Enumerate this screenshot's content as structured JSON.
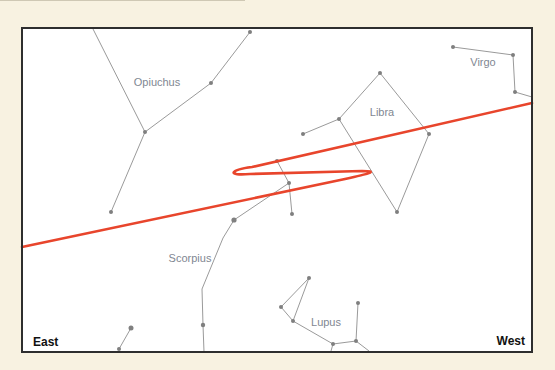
{
  "diagram": {
    "type": "sky-chart",
    "frame": {
      "x1": 22,
      "y1": 28,
      "x2": 532,
      "y2": 352
    },
    "colors": {
      "background": "#f8f2e1",
      "frame": "#2e2e2e",
      "path": "#e8452c",
      "constellation_lines": "#9a9a9a",
      "stars": "#7f7f7f",
      "labels": "#7f8792"
    },
    "directions": {
      "east": "East",
      "west": "West"
    },
    "constellations": [
      {
        "name": "Opiuchus",
        "label_pos": [
          157,
          82
        ]
      },
      {
        "name": "Libra",
        "label_pos": [
          382,
          112
        ]
      },
      {
        "name": "Virgo",
        "label_pos": [
          483,
          62
        ]
      },
      {
        "name": "Scorpius",
        "label_pos": [
          190,
          258
        ]
      },
      {
        "name": "Lupus",
        "label_pos": [
          326,
          322
        ]
      }
    ],
    "path_description": "Apparent path with retrograde loop"
  }
}
